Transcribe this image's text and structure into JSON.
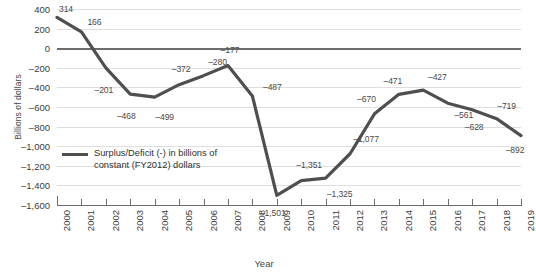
{
  "chart_data": {
    "type": "line",
    "title": "",
    "subtitle": "",
    "xlabel": "Year",
    "ylabel": "Billions of dollars",
    "categories": [
      "2000",
      "2001",
      "2002",
      "2003",
      "2004",
      "2005",
      "2006",
      "2007",
      "2008",
      "2009",
      "2010",
      "2011",
      "2012",
      "2013",
      "2014",
      "2015",
      "2016",
      "2017",
      "2018",
      "2019"
    ],
    "series": [
      {
        "name": "Surplus/Deficit (-) in billions of constant (FY2012) dollars",
        "color": "#4f4f4f",
        "values": [
          314,
          166,
          -201,
          -468,
          -499,
          -372,
          -280,
          -177,
          -487,
          -1501,
          -1351,
          -1325,
          -1077,
          -670,
          -471,
          -427,
          -561,
          -628,
          -719,
          -892
        ],
        "labels": [
          "314",
          "166",
          "–201",
          "–468",
          "–499",
          "–372",
          "–280",
          "–177",
          "–487",
          "–1,501",
          "–1,351",
          "–1,325",
          "–1,077",
          "–670",
          "–471",
          "–427",
          "–561",
          "–628",
          "–719",
          "–892"
        ]
      }
    ],
    "ylim": [
      -1600,
      400
    ],
    "yticks": [
      400,
      200,
      0,
      -200,
      -400,
      -600,
      -800,
      -1000,
      -1200,
      -1400,
      -1600
    ],
    "ytick_labels": [
      "400",
      "200",
      "0",
      "–200",
      "–400",
      "–600",
      "–800",
      "–1,000",
      "–1,200",
      "–1,400",
      "–1,600"
    ],
    "grid": true,
    "grid_color": "#dedede",
    "zero_line_color": "#6d6d6d",
    "legend": {
      "position": "inside-left",
      "entries": [
        {
          "label_line1": "Surplus/Deficit (-) in billions of",
          "label_line2": "constant (FY2012) dollars",
          "color": "#4f4f4f"
        }
      ]
    },
    "background": "#ffffff"
  }
}
